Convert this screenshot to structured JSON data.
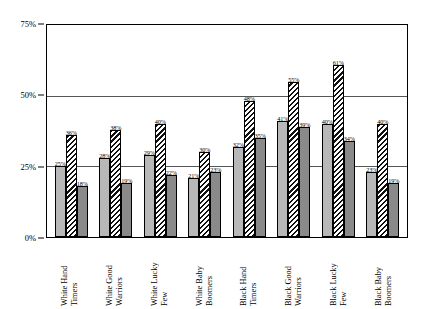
{
  "chart_data": {
    "type": "bar",
    "title": "",
    "xlabel": "",
    "ylabel": "",
    "ylim": [
      0,
      75
    ],
    "yticks": [
      "0%",
      "25%",
      "50%",
      "75%"
    ],
    "ytick_values": [
      0,
      25,
      50,
      75
    ],
    "gridlines": [
      25,
      50
    ],
    "legend": "none",
    "categories": [
      "White Hand Timers",
      "White Good Warriors",
      "White Lucky Few",
      "White Baby Boomers",
      "Black Hand Timers",
      "Black Good Warriors",
      "Black Lucky Few",
      "Black Baby Boomers"
    ],
    "series": [
      {
        "name": "series-1",
        "pattern": "dotted-gray",
        "values": [
          25,
          28,
          29,
          21,
          32,
          41,
          40,
          23
        ],
        "labels": [
          "25%",
          "28%",
          "29%",
          "21%",
          "32%",
          "41%",
          "40%",
          "23%"
        ]
      },
      {
        "name": "series-2",
        "pattern": "diagonal-hatch",
        "values": [
          36,
          38,
          40,
          30,
          48,
          55,
          61,
          40
        ],
        "labels": [
          "36%",
          "38%",
          "40%",
          "30%",
          "48%",
          "55%",
          "61%",
          "40%"
        ]
      },
      {
        "name": "series-3",
        "pattern": "solid-gray",
        "values": [
          18,
          19,
          22,
          23,
          35,
          39,
          34,
          19
        ],
        "labels": [
          "18%",
          "19%",
          "22%",
          "23%",
          "35%",
          "39%",
          "34%",
          "19%"
        ]
      }
    ]
  },
  "axis": {
    "y_label_0": "0%",
    "y_label_25": "25%",
    "y_label_50": "50%",
    "y_label_75": "75%"
  },
  "category_lines": [
    [
      "White Hand",
      "Timers"
    ],
    [
      "White Good",
      "Warriors"
    ],
    [
      "White Lucky",
      "Few"
    ],
    [
      "White Baby",
      "Boomers"
    ],
    [
      "Black Hand",
      "Timers"
    ],
    [
      "Black Good",
      "Warriors"
    ],
    [
      "Black Lucky",
      "Few"
    ],
    [
      "Black Baby",
      "Boomers"
    ]
  ]
}
